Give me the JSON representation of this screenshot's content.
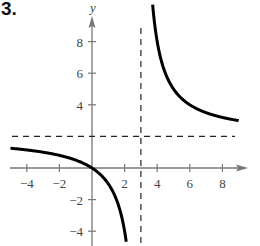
{
  "problem_number": "3.",
  "chart_data": {
    "type": "line",
    "title": "",
    "function": "f(x) = 2x / (x - 3)",
    "xlabel": "x",
    "ylabel": "y",
    "xlim": [
      -4.8,
      9.5
    ],
    "ylim": [
      -5,
      9.5
    ],
    "x_ticks": [
      -4,
      -2,
      2,
      4,
      6,
      8
    ],
    "y_ticks": [
      -4,
      -2,
      4,
      6,
      8
    ],
    "x_tick_labels": [
      "−4",
      "−2",
      "2",
      "4",
      "6",
      "8"
    ],
    "y_tick_labels": [
      "−4",
      "−2",
      "4",
      "6",
      "8"
    ],
    "grid": false,
    "asymptotes": {
      "vertical": {
        "x": 3,
        "style": "dashed"
      },
      "horizontal": {
        "y": 2,
        "style": "dashed"
      }
    },
    "series": [
      {
        "name": "left branch",
        "points": [
          [
            -4.8,
            1.23
          ],
          [
            -4,
            1.14
          ],
          [
            -2,
            0.8
          ],
          [
            0,
            0
          ],
          [
            1,
            -1
          ],
          [
            2,
            -4
          ],
          [
            2.1,
            -4.67
          ]
        ]
      },
      {
        "name": "right branch",
        "points": [
          [
            3.67,
            11
          ],
          [
            4,
            8
          ],
          [
            5,
            5
          ],
          [
            6,
            4
          ],
          [
            7,
            3.5
          ],
          [
            8,
            3.2
          ],
          [
            9,
            3
          ]
        ]
      }
    ]
  },
  "colors": {
    "axis": "#777777",
    "curve": "#000000",
    "asymptote": "#222222",
    "labels": "#444444"
  }
}
